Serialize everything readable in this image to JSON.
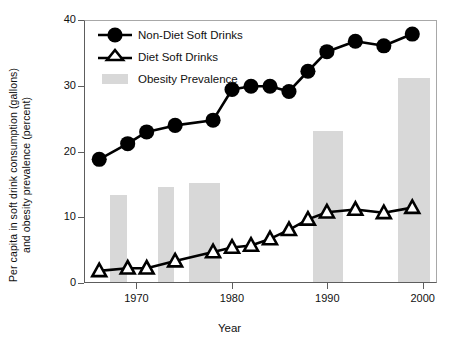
{
  "figure": {
    "xlabel": "Year",
    "ylabel_line1": "Per capita in soft drink consumption (gallons)",
    "ylabel_line2": "and obesity prevalence (percent)"
  },
  "legend": {
    "items": [
      {
        "label": "Non-Diet Soft Drinks",
        "marker": "filled-circle-marker",
        "color": "#000000"
      },
      {
        "label": "Diet Soft Drinks",
        "marker": "open-triangle-marker",
        "color": "#000000"
      },
      {
        "label": "Obesity Prevalence",
        "marker": "gray-bar-swatch",
        "color": "#d8d8d8"
      }
    ]
  },
  "axes": {
    "y_ticks": [
      "0",
      "10",
      "20",
      "30",
      "40"
    ],
    "x_ticks": [
      "1970",
      "1980",
      "1990",
      "2000"
    ]
  },
  "chart_data": {
    "type": "line",
    "title": "",
    "xlabel": "Year",
    "ylabel": "Per capita in soft drink consumption (gallons) and obesity prevalence (percent)",
    "xlim": [
      1964.5,
      2001.5
    ],
    "ylim": [
      0,
      40
    ],
    "grid": false,
    "legend_position": "top-left inside",
    "series": [
      {
        "name": "Non-Diet Soft Drinks",
        "type": "line",
        "marker": "filled circle",
        "color": "#000000",
        "x": [
          1966,
          1969,
          1971,
          1974,
          1978,
          1980,
          1982,
          1984,
          1986,
          1988,
          1990,
          1993,
          1996,
          1999
        ],
        "values": [
          18.8,
          21.2,
          23.0,
          24.0,
          24.8,
          29.5,
          30.0,
          30.0,
          29.2,
          32.3,
          35.3,
          36.9,
          36.2,
          38.0
        ]
      },
      {
        "name": "Diet Soft Drinks",
        "type": "line",
        "marker": "open triangle",
        "color": "#000000",
        "x": [
          1966,
          1969,
          1971,
          1974,
          1978,
          1980,
          1982,
          1984,
          1986,
          1988,
          1990,
          1993,
          1996,
          1999
        ],
        "values": [
          1.7,
          2.1,
          2.1,
          3.2,
          4.6,
          5.3,
          5.6,
          6.6,
          8.0,
          9.6,
          10.7,
          11.1,
          10.6,
          11.4
        ]
      },
      {
        "name": "Obesity Prevalence",
        "type": "bar",
        "color": "#d8d8d8",
        "x": [
          1968,
          1973,
          1977,
          1990,
          1999
        ],
        "values": [
          13.2,
          14.4,
          15.1,
          23.0,
          31.0
        ],
        "bar_widths_years": [
          1.7,
          1.7,
          3.3,
          3.1,
          3.3
        ]
      }
    ]
  }
}
